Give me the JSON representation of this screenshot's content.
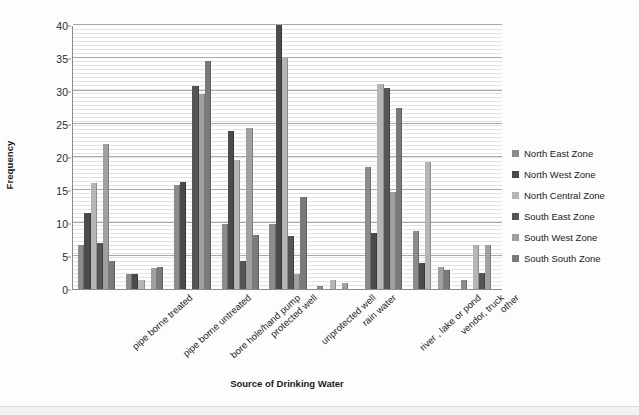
{
  "chart_data": {
    "type": "bar",
    "title": "",
    "xlabel": "Source of Drinking Water",
    "ylabel": "Frequency",
    "ylim": [
      0,
      40
    ],
    "ytick_step": 5,
    "yticks": [
      0,
      5,
      10,
      15,
      20,
      25,
      30,
      35,
      40
    ],
    "grid": true,
    "legend_position": "right",
    "categories": [
      "pipe borne treated",
      "pipe borne untreated",
      "bore hole/hand pump",
      "protected well",
      "unprotected well",
      "rain water",
      "river , lake or pond",
      "vendor, truck",
      "other"
    ],
    "series": [
      {
        "name": "North East Zone",
        "color": "#8c8c8c",
        "values": [
          6.7,
          2.2,
          15.7,
          9.8,
          9.8,
          0.5,
          18.5,
          8.8,
          1.4
        ]
      },
      {
        "name": "North West Zone",
        "color": "#4a4a4a",
        "values": [
          11.5,
          2.3,
          16.2,
          24.0,
          40.0,
          0.0,
          8.5,
          4.0,
          0.0
        ]
      },
      {
        "name": "North Central Zone",
        "color": "#b5b5b5",
        "values": [
          16.0,
          1.3,
          0.0,
          19.6,
          35.0,
          1.4,
          31.0,
          19.2,
          6.7
        ]
      },
      {
        "name": "South East Zone",
        "color": "#555555",
        "values": [
          7.0,
          0.0,
          30.8,
          4.3,
          8.0,
          0.0,
          30.5,
          0.0,
          2.4
        ]
      },
      {
        "name": "South West Zone",
        "color": "#a0a0a0",
        "values": [
          22.0,
          3.2,
          29.5,
          24.4,
          2.2,
          0.9,
          14.7,
          3.3,
          6.6
        ]
      },
      {
        "name": "South South Zone",
        "color": "#7a7a7a",
        "values": [
          4.2,
          3.3,
          34.5,
          8.2,
          14.0,
          0.0,
          27.5,
          2.9,
          0.0
        ]
      }
    ]
  },
  "legend": {
    "items": [
      "North East Zone",
      "North West Zone",
      "North Central Zone",
      "South East Zone",
      "South West Zone",
      "South South Zone"
    ]
  }
}
